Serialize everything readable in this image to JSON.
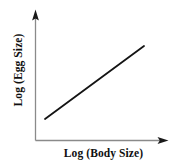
{
  "figure": {
    "background_color": "#ffffff",
    "axis_color": "#8a8a8a",
    "arrow_color": "#1a1a1a",
    "line_color": "#141414",
    "text_color": "#101010"
  },
  "axes": {
    "x_label": "Log (Body Size)",
    "y_label": "Log (Egg Size)"
  },
  "chart_data": {
    "type": "line",
    "title": "",
    "xlabel": "Log (Body Size)",
    "ylabel": "Log (Egg Size)",
    "grid": false,
    "legend": null,
    "axis_arrows": true,
    "tick_labels": {
      "x": [],
      "y": []
    },
    "xlim": [
      0,
      1
    ],
    "ylim": [
      0,
      1
    ],
    "series": [
      {
        "name": "allometric relationship",
        "x": [
          0.075,
          1.0
        ],
        "y": [
          0.162,
          0.723
        ],
        "style": "solid",
        "color": "#141414",
        "width": 1.8
      }
    ],
    "annotations": []
  }
}
